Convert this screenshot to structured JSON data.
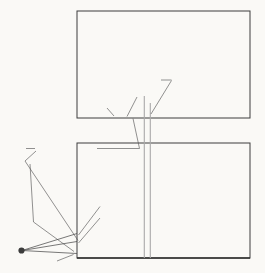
{
  "figure": {
    "background": "#faf9f6",
    "ink": "#2f2f2f",
    "border_color": "#3d3d3d",
    "construction_color": "#565656",
    "gray_line_color": "#a9a9a9",
    "dashed_color": "#8f8f8f",
    "hatch_color": "#8d8d8d"
  },
  "chart_data": [
    {
      "type": "line",
      "name": "derivative-plot",
      "x_range": [
        0,
        4
      ],
      "y_range": [
        0,
        50
      ],
      "grid_x": [
        1,
        2,
        3
      ],
      "x_tick_labels": [
        "0",
        "1",
        "2",
        "3",
        "4"
      ],
      "y_tick_labels": [
        "0",
        "20",
        "40"
      ],
      "y_tick_step": 10,
      "legend": "none",
      "series": [
        {
          "name": "slope-curve",
          "x": [
            0.2,
            0.5,
            0.75,
            1.0,
            1.25,
            1.5,
            1.75,
            2.0,
            2.2,
            2.33
          ],
          "y": [
            0.05,
            0.15,
            0.3,
            0.5,
            0.95,
            1.6,
            2.7,
            4.0,
            5.0,
            5.7
          ]
        }
      ],
      "annotations": [
        {
          "text": "AP",
          "points_at_x": 0.85
        },
        {
          "text": "BP",
          "points_at_x": 1.2
        },
        {
          "text": "CP",
          "points_at_x": 1.7
        }
      ]
    },
    {
      "type": "line",
      "name": "function-plot",
      "x_range": [
        0,
        4
      ],
      "y_range": [
        0,
        35.6
      ],
      "grid_x": [
        1,
        2,
        3
      ],
      "x_tick_labels": [
        "0",
        "1",
        "2",
        "3",
        "4"
      ],
      "y_tick_labels": [
        "20"
      ],
      "y_tick_value": 20,
      "legend": "none",
      "series": [
        {
          "name": "main-curve",
          "x": [
            0,
            0.25,
            0.5,
            0.75,
            1.0,
            1.25,
            1.5,
            1.75,
            2.0,
            2.25,
            2.5,
            2.75,
            3.0,
            3.25,
            3.5,
            3.75,
            4.0
          ],
          "y": [
            0,
            0.08,
            0.32,
            0.75,
            1.3,
            2.1,
            3.3,
            5.1,
            7.3,
            9.6,
            12.2,
            15.0,
            18.0,
            20.8,
            23.5,
            26.0,
            28.3
          ]
        }
      ],
      "rectangles": [
        {
          "x0": 0,
          "x1": 1.0,
          "height": 1.24,
          "hatch": "single",
          "axis_point": "A"
        },
        {
          "x0": 1.0,
          "x1": 1.55,
          "height": 5.3,
          "hatch": "single",
          "axis_point": "B"
        },
        {
          "x0": 1.55,
          "x1": 2.05,
          "height": 7.75,
          "hatch": "cross",
          "axis_point": "C"
        }
      ],
      "dashed_levels": [
        {
          "value": 7.75,
          "x_end": 2.05
        },
        {
          "value": 5.3,
          "x_end": 1.59
        }
      ],
      "pole": {
        "label": "P",
        "x": -1.28,
        "y": 2.3
      },
      "annotations": [
        {
          "text": "PARALLEL"
        },
        {
          "text": "A"
        },
        {
          "text": "B"
        },
        {
          "text": "C"
        },
        {
          "text": "P"
        }
      ]
    }
  ]
}
